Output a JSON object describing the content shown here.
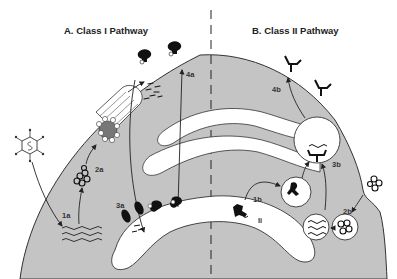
{
  "diagram": {
    "titles": {
      "left": "A.  Class I Pathway",
      "right": "B.  Class II Pathway"
    },
    "labels": {
      "step_1a": "1a",
      "step_2a": "2a",
      "step_3a": "3a",
      "step_4a": "4a",
      "step_1b": "1b",
      "step_2b": "2b",
      "step_3b": "3b",
      "step_4b": "4b",
      "invariant_chain": "Ii"
    },
    "colors": {
      "cytoplasm": "#c4c4c4",
      "organelle": "#ffffff",
      "outline": "#3a3a3a",
      "molecule": "#111111",
      "background": "#ffffff"
    }
  }
}
